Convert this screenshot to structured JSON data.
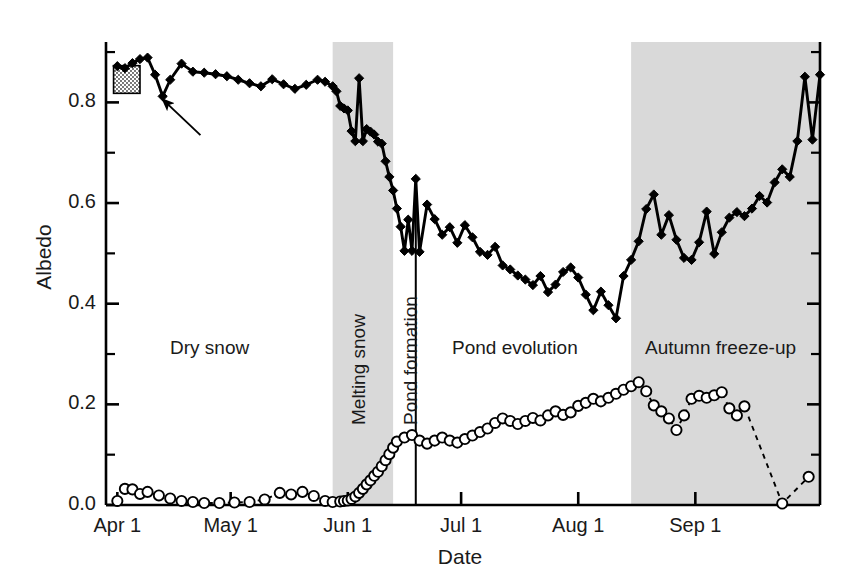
{
  "chart_data": {
    "type": "line",
    "title": "",
    "xlabel": "Date",
    "ylabel": "Albedo",
    "xlim": [
      "Apr 1",
      "Sep 30"
    ],
    "ylim": [
      0.0,
      0.92
    ],
    "grid": false,
    "legend_position": "none",
    "ytick_labels": [
      "0.0",
      "0.2",
      "0.4",
      "0.6",
      "0.8"
    ],
    "ytick_values": [
      0.0,
      0.2,
      0.4,
      0.6,
      0.8
    ],
    "yminor_values": [
      0.1,
      0.3,
      0.5,
      0.7,
      0.9
    ],
    "xtick_labels": [
      "Apr 1",
      "May 1",
      "Jun 1",
      "Jul 1",
      "Aug 1",
      "Sep 1"
    ],
    "xtick_days": [
      0,
      30,
      61,
      91,
      122,
      153
    ],
    "x_axis_day_range": [
      -3,
      186
    ],
    "series": [
      {
        "name": "Albedo",
        "marker": "filled-diamond",
        "line_style": "solid",
        "x_days": [
          0,
          2,
          4,
          6,
          8,
          10,
          12,
          14,
          17,
          20,
          23,
          26,
          29,
          32,
          35,
          38,
          41,
          44,
          47,
          50,
          53,
          55,
          57,
          58,
          59,
          60,
          61,
          62,
          63,
          64,
          65,
          66,
          67,
          68,
          69,
          70,
          71,
          72,
          73,
          74,
          75,
          76,
          77,
          78,
          79,
          80,
          82,
          84,
          86,
          88,
          90,
          92,
          94,
          96,
          98,
          100,
          102,
          104,
          106,
          108,
          110,
          112,
          114,
          116,
          118,
          120,
          122,
          124,
          126,
          128,
          130,
          132,
          134,
          136,
          138,
          140,
          142,
          144,
          146,
          148,
          150,
          152,
          154,
          156,
          158,
          160,
          162,
          164,
          166,
          168,
          170,
          172,
          174,
          176,
          178,
          180,
          182,
          184
        ],
        "y_values": [
          0.872,
          0.868,
          0.878,
          0.886,
          0.889,
          0.855,
          0.812,
          0.845,
          0.877,
          0.861,
          0.859,
          0.856,
          0.852,
          0.845,
          0.838,
          0.832,
          0.846,
          0.836,
          0.827,
          0.835,
          0.845,
          0.841,
          0.832,
          0.822,
          0.793,
          0.788,
          0.784,
          0.743,
          0.723,
          0.848,
          0.723,
          0.747,
          0.742,
          0.736,
          0.722,
          0.718,
          0.683,
          0.652,
          0.625,
          0.589,
          0.553,
          0.505,
          0.567,
          0.505,
          0.648,
          0.503,
          0.597,
          0.568,
          0.537,
          0.552,
          0.521,
          0.556,
          0.532,
          0.503,
          0.497,
          0.513,
          0.476,
          0.468,
          0.456,
          0.448,
          0.437,
          0.455,
          0.423,
          0.438,
          0.463,
          0.472,
          0.452,
          0.418,
          0.387,
          0.424,
          0.397,
          0.371,
          0.455,
          0.487,
          0.524,
          0.588,
          0.617,
          0.537,
          0.576,
          0.527,
          0.491,
          0.487,
          0.522,
          0.583,
          0.499,
          0.542,
          0.571,
          0.582,
          0.574,
          0.589,
          0.614,
          0.601,
          0.641,
          0.667,
          0.652,
          0.723,
          0.851,
          0.726
        ],
        "y_end": 0.855
      },
      {
        "name": "Pond fraction",
        "marker": "open-circle",
        "line_style": "dashed",
        "x_days": [
          0,
          2,
          4,
          6,
          8,
          11,
          14,
          17,
          20,
          23,
          27,
          31,
          35,
          39,
          43,
          46,
          49,
          52,
          55,
          57,
          59,
          60,
          61,
          62,
          63,
          64,
          65,
          66,
          67,
          68,
          69,
          70,
          71,
          72,
          73,
          74,
          76,
          78,
          80,
          82,
          84,
          86,
          88,
          90,
          92,
          94,
          96,
          98,
          100,
          102,
          104,
          106,
          108,
          110,
          112,
          114,
          116,
          118,
          120,
          122,
          124,
          126,
          128,
          130,
          132,
          134,
          136,
          138,
          140,
          142,
          144,
          146,
          148,
          150,
          152,
          154,
          156,
          158,
          160,
          162,
          164,
          166,
          176,
          183
        ],
        "y_values": [
          0.008,
          0.032,
          0.031,
          0.022,
          0.026,
          0.019,
          0.013,
          0.008,
          0.006,
          0.004,
          0.004,
          0.005,
          0.006,
          0.011,
          0.024,
          0.021,
          0.026,
          0.018,
          0.008,
          0.006,
          0.007,
          0.008,
          0.009,
          0.012,
          0.017,
          0.024,
          0.032,
          0.041,
          0.049,
          0.058,
          0.066,
          0.077,
          0.089,
          0.101,
          0.114,
          0.126,
          0.134,
          0.139,
          0.128,
          0.122,
          0.128,
          0.134,
          0.128,
          0.124,
          0.131,
          0.138,
          0.145,
          0.152,
          0.163,
          0.172,
          0.167,
          0.161,
          0.167,
          0.173,
          0.168,
          0.178,
          0.186,
          0.179,
          0.184,
          0.197,
          0.203,
          0.211,
          0.206,
          0.213,
          0.221,
          0.229,
          0.236,
          0.244,
          0.226,
          0.198,
          0.186,
          0.172,
          0.149,
          0.178,
          0.211,
          0.217,
          0.213,
          0.218,
          0.224,
          0.192,
          0.178,
          0.196,
          0.003,
          0.056
        ]
      }
    ],
    "regions": [
      {
        "id": "dry-snow",
        "label": "Dry snow",
        "start_day": -3,
        "end_day": 57,
        "shaded": false,
        "orientation": "horizontal"
      },
      {
        "id": "melting-snow",
        "label": "Melting snow",
        "start_day": 57,
        "end_day": 73,
        "shaded": true,
        "orientation": "vertical"
      },
      {
        "id": "pond-formation",
        "label": "Pond formation",
        "start_day": 73,
        "end_day": 79,
        "shaded": false,
        "orientation": "vertical"
      },
      {
        "id": "pond-evolution",
        "label": "Pond evolution",
        "start_day": 79,
        "end_day": 136,
        "shaded": false,
        "orientation": "horizontal"
      },
      {
        "id": "autumn-freeze-up",
        "label": "Autumn freeze-up",
        "start_day": 136,
        "end_day": 186,
        "shaded": true,
        "orientation": "horizontal"
      }
    ],
    "annotations": [
      {
        "id": "stipple-box",
        "type": "stippled-rectangle",
        "x_start_day": -1,
        "x_end_day": 6,
        "y_bottom": 0.818,
        "y_top": 0.873
      },
      {
        "id": "callout-arrow",
        "type": "arrow",
        "tip_x_day": 12,
        "tip_y": 0.806,
        "tail_x_day": 22,
        "tail_y": 0.735
      },
      {
        "id": "pond-formation-divider",
        "type": "vertical-line",
        "x_day": 79,
        "y_bottom": 0.0,
        "y_top": 0.645
      }
    ],
    "colors": {
      "shade": "#d9d9d9",
      "line": "#000000",
      "text": "#1a1a1a",
      "marker_fill": "#000000",
      "circle_fill": "#ffffff"
    }
  }
}
